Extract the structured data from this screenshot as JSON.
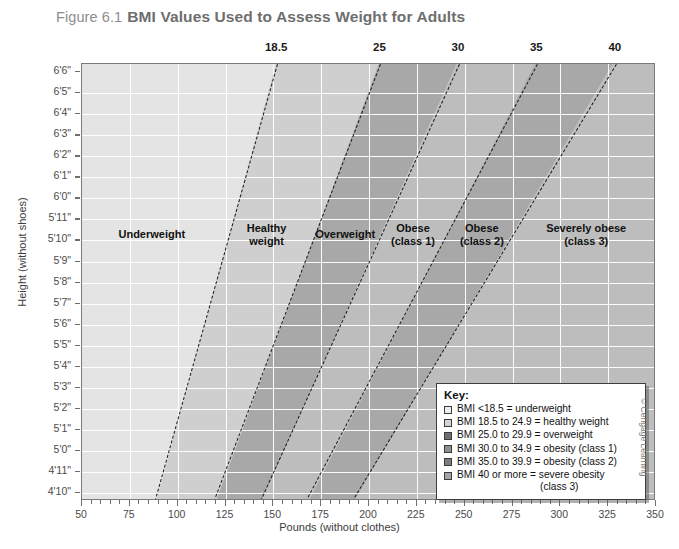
{
  "figure": {
    "number": "Figure 6.1",
    "title": "BMI Values Used to Assess Weight for Adults",
    "credit": "© Cengage Learning"
  },
  "chart_data": {
    "type": "area",
    "title": "BMI Values Used to Assess Weight for Adults",
    "xlabel": "Pounds (without clothes)",
    "ylabel": "Height (without shoes)",
    "xlim": [
      50,
      350
    ],
    "ylim_labels": [
      "4'10\"",
      "6'6\""
    ],
    "grid": true,
    "legend_position": "inside-bottom-right",
    "x_ticks": [
      50,
      75,
      100,
      125,
      150,
      175,
      200,
      225,
      250,
      275,
      300,
      325,
      350
    ],
    "x_tick_labels": [
      "50",
      "75",
      "100",
      "125",
      "150",
      "175",
      "200",
      "225",
      "250",
      "275",
      "300",
      "325",
      "350"
    ],
    "x_minor_tick_step": 5,
    "y_ticks": [
      "4'10\"",
      "4'11\"",
      "5'0\"",
      "5'1\"",
      "5'2\"",
      "5'3\"",
      "5'4\"",
      "5'5\"",
      "5'6\"",
      "5'7\"",
      "5'8\"",
      "5'9\"",
      "5'10\"",
      "5'11\"",
      "6'0\"",
      "6'1\"",
      "6'2\"",
      "6'3\"",
      "6'4\"",
      "6'5\"",
      "6'6\""
    ],
    "top_axis_label": "BMI",
    "top_ticks": [
      18.5,
      25,
      30,
      35,
      40
    ],
    "top_tick_labels": [
      "18.5",
      "25",
      "30",
      "35",
      "40"
    ],
    "bmi_boundary_lines": [
      {
        "bmi": "18.5",
        "x_at_top_height": 152,
        "x_at_bottom_height": 88
      },
      {
        "bmi": "25",
        "x_at_top_height": 206,
        "x_at_bottom_height": 119
      },
      {
        "bmi": "30",
        "x_at_top_height": 247,
        "x_at_bottom_height": 143
      },
      {
        "bmi": "35",
        "x_at_top_height": 288,
        "x_at_bottom_height": 167
      },
      {
        "bmi": "40",
        "x_at_top_height": 329,
        "x_at_bottom_height": 191
      }
    ],
    "bands": [
      {
        "name": "Underweight",
        "bmi_range": "<18.5",
        "color": "#e4e4e4"
      },
      {
        "name": "Healthy weight",
        "bmi_range": "18.5 to 24.9",
        "color": "#cfcfcf"
      },
      {
        "name": "Overweight",
        "bmi_range": "25.0 to 29.9",
        "color": "#a8a8a8"
      },
      {
        "name": "Obese (class 1)",
        "bmi_range": "30.0 to 34.9",
        "color": "#bdbdbd"
      },
      {
        "name": "Obese (class 2)",
        "bmi_range": "35.0 to 39.9",
        "color": "#a8a8a8"
      },
      {
        "name": "Severely obese (class 3)",
        "bmi_range": "40 or more",
        "color": "#bdbdbd"
      }
    ]
  },
  "band_labels": [
    {
      "line1": "Underweight",
      "line2": ""
    },
    {
      "line1": "Healthy",
      "line2": "weight"
    },
    {
      "line1": "Overweight",
      "line2": ""
    },
    {
      "line1": "Obese",
      "line2": "(class 1)"
    },
    {
      "line1": "Obese",
      "line2": "(class 2)"
    },
    {
      "line1": "Severely obese",
      "line2": "(class 3)"
    }
  ],
  "axes": {
    "x_title": "Pounds (without clothes)",
    "y_title": "Height (without shoes)",
    "x_tick_labels": [
      "50",
      "75",
      "100",
      "125",
      "150",
      "175",
      "200",
      "225",
      "250",
      "275",
      "300",
      "325",
      "350"
    ],
    "y_tick_labels": [
      "6'6\"",
      "6'5\"",
      "6'4\"",
      "6'3\"",
      "6'2\"",
      "6'1\"",
      "6'0\"",
      "5'11\"",
      "5'10\"",
      "5'9\"",
      "5'8\"",
      "5'7\"",
      "5'6\"",
      "5'5\"",
      "5'4\"",
      "5'3\"",
      "5'2\"",
      "5'1\"",
      "5'0\"",
      "4'11\"",
      "4'10\""
    ],
    "top_tick_labels": [
      "18.5",
      "25",
      "30",
      "35",
      "40"
    ]
  },
  "legend": {
    "title": "Key:",
    "items": [
      {
        "label": "BMI <18.5 = underweight",
        "color": "#ededed"
      },
      {
        "label": "BMI 18.5 to 24.9 = healthy weight",
        "color": "#d4d4d4"
      },
      {
        "label": "BMI 25.0 to 29.9 = overweight",
        "color": "#6f6f6f"
      },
      {
        "label": "BMI 30.0 to 34.9 = obesity (class 1)",
        "color": "#8f8f8f"
      },
      {
        "label": "BMI 35.0 to 39.9 = obesity (class 2)",
        "color": "#7b7b7b"
      },
      {
        "label": "BMI 40 or more = severe obesity",
        "color": "#a5a5a5"
      }
    ],
    "continuation": "(class 3)"
  }
}
